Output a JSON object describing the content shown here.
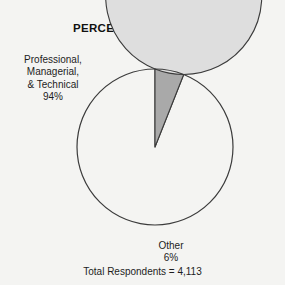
{
  "figure": {
    "title": "PERCENT OF READERS",
    "footer": "Total Respondents = 4,113",
    "background_color": "#f4f4f2",
    "outline_color": "#3b3b3b"
  },
  "labels": {
    "professional": {
      "line1": "Professional,",
      "line2": "Managerial,",
      "line3": "& Technical",
      "line4": "94%"
    },
    "other": {
      "line1": "Other",
      "line2": "6%"
    }
  },
  "chart_data": {
    "type": "pie",
    "title": "PERCENT OF READERS",
    "categories": [
      "Professional, Managerial, & Technical",
      "Other"
    ],
    "values": [
      94,
      6
    ],
    "value_labels": [
      "94%",
      "6%"
    ],
    "units": "percent",
    "total_respondents": "4,113",
    "start_angle_deg": 180,
    "direction": "clockwise",
    "colors": [
      "#dedede",
      "#a9a9a9"
    ],
    "legend": "none",
    "grid": false,
    "xlabel": "",
    "ylabel": "",
    "annotations": [
      "Professional, Managerial, & Technical 94%",
      "Other 6%",
      "Total Respondents = 4,113"
    ]
  }
}
